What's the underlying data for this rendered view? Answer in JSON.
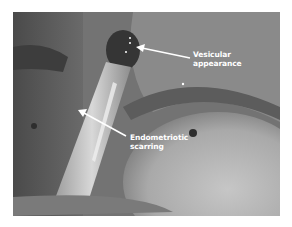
{
  "figure": {
    "type": "laparoscopic photograph",
    "palette": {
      "background": "#ffffff",
      "tissue_mid": "#6f6f6f",
      "tissue_dark": "#3a3a3a",
      "tissue_light": "#bdbdbd",
      "annotation": "#ffffff"
    },
    "annotations": [
      {
        "label_line1": "Vesicular",
        "label_line2": "appearance",
        "arrow_icon": "arrow-left-icon"
      },
      {
        "label_line1": "Endometriotic",
        "label_line2": "scarring",
        "arrow_icon": "arrow-up-left-icon"
      }
    ]
  }
}
